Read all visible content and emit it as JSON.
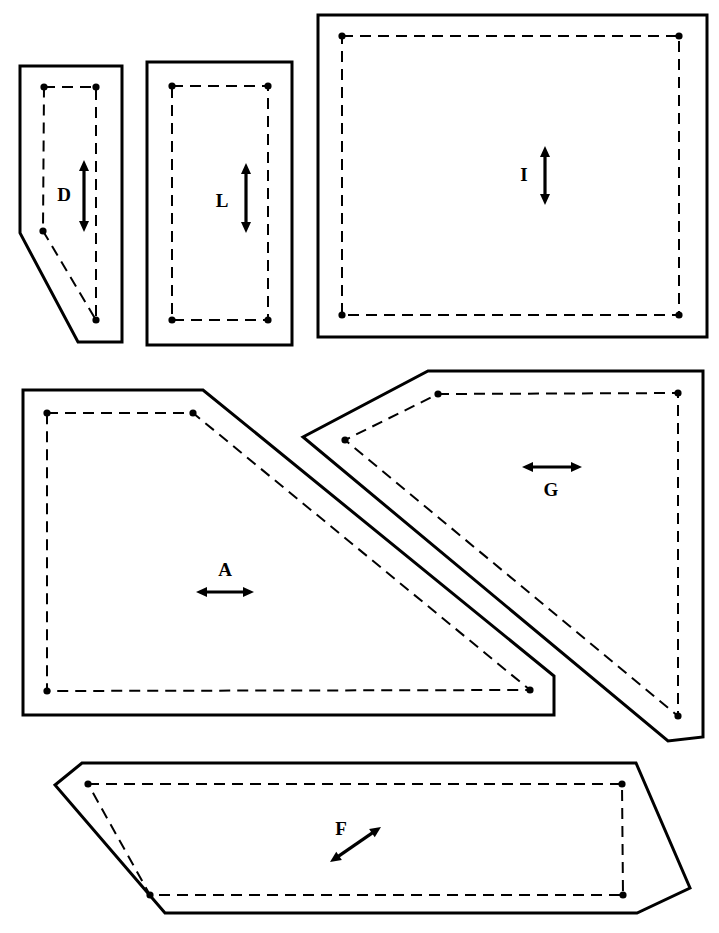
{
  "sheet": {
    "width": 719,
    "height": 933,
    "background": "#ffffff",
    "line_color": "#000000",
    "description": "Technical pattern-piece layout diagram with six labelled cut pieces"
  },
  "legend": {
    "cut_line": "solid outer cutting line",
    "seam_line": "dashed inner seam line",
    "notch": "filled corner dot marker",
    "grain": "double-headed grain direction arrow"
  },
  "pieces": [
    {
      "id": "D",
      "label": "D",
      "shape": "pentagon",
      "grain": "vertical",
      "label_x": 64,
      "label_y": 197,
      "arrow": {
        "x1": 84,
        "y1": 160,
        "x2": 84,
        "y2": 232,
        "direction": "vertical"
      },
      "cut_points": "20,66 122,66 122,342 78,342 20,233",
      "seam_points": "44,87 96,87 96,320 43,231 44,87",
      "dots": [
        {
          "x": 44,
          "y": 87
        },
        {
          "x": 96,
          "y": 87
        },
        {
          "x": 96,
          "y": 320
        },
        {
          "x": 43,
          "y": 231
        }
      ]
    },
    {
      "id": "L",
      "label": "L",
      "shape": "rectangle",
      "grain": "vertical",
      "label_x": 222,
      "label_y": 203,
      "arrow": {
        "x1": 246,
        "y1": 163,
        "x2": 246,
        "y2": 233,
        "direction": "vertical"
      },
      "cut_points": "147,62 292,62 292,345 147,345",
      "seam_points": "172,86 268,86 268,320 172,320 172,86",
      "dots": [
        {
          "x": 172,
          "y": 86
        },
        {
          "x": 268,
          "y": 86
        },
        {
          "x": 268,
          "y": 320
        },
        {
          "x": 172,
          "y": 320
        }
      ]
    },
    {
      "id": "I",
      "label": "I",
      "shape": "rectangle",
      "grain": "vertical",
      "label_x": 524,
      "label_y": 177,
      "arrow": {
        "x1": 545,
        "y1": 146,
        "x2": 545,
        "y2": 205,
        "direction": "vertical"
      },
      "cut_points": "318,15 707,15 707,337 318,337",
      "seam_points": "342,36 679,36 679,315 342,315 342,36",
      "dots": [
        {
          "x": 342,
          "y": 36
        },
        {
          "x": 679,
          "y": 36
        },
        {
          "x": 679,
          "y": 315
        },
        {
          "x": 342,
          "y": 315
        }
      ]
    },
    {
      "id": "A",
      "label": "A",
      "shape": "quadrilateral-with-diagonal",
      "grain": "horizontal",
      "label_x": 225,
      "label_y": 572,
      "arrow": {
        "x1": 196,
        "y1": 592,
        "x2": 254,
        "y2": 592,
        "direction": "horizontal"
      },
      "cut_points": "23,390 203,390 554,676 554,715 23,715",
      "seam_points": "47,413 193,413 530,690 47,691 47,413",
      "dots": [
        {
          "x": 47,
          "y": 413
        },
        {
          "x": 193,
          "y": 413
        },
        {
          "x": 530,
          "y": 690
        },
        {
          "x": 47,
          "y": 691
        }
      ]
    },
    {
      "id": "G",
      "label": "G",
      "shape": "chevron-wedge",
      "grain": "horizontal",
      "label_x": 551,
      "label_y": 492,
      "arrow": {
        "x1": 522,
        "y1": 467,
        "x2": 582,
        "y2": 467,
        "direction": "horizontal"
      },
      "cut_points": "428,371 703,371 703,737 668,741 303,437",
      "seam_points": "438,394 678,393 678,716 345,440 438,394",
      "dots": [
        {
          "x": 438,
          "y": 394
        },
        {
          "x": 678,
          "y": 393
        },
        {
          "x": 678,
          "y": 716
        },
        {
          "x": 345,
          "y": 440
        }
      ]
    },
    {
      "id": "F",
      "label": "F",
      "shape": "parallelogram",
      "grain": "diagonal",
      "label_x": 341,
      "label_y": 831,
      "arrow": {
        "x1": 330,
        "y1": 862,
        "x2": 381,
        "y2": 827,
        "direction": "diagonal"
      },
      "cut_points": "82,763 636,763 690,888 637,913 165,913 55,785",
      "seam_points": "88,784 622,784 623,895 150,895 88,784",
      "dots": [
        {
          "x": 88,
          "y": 784
        },
        {
          "x": 622,
          "y": 784
        },
        {
          "x": 623,
          "y": 895
        },
        {
          "x": 150,
          "y": 895
        }
      ]
    }
  ]
}
